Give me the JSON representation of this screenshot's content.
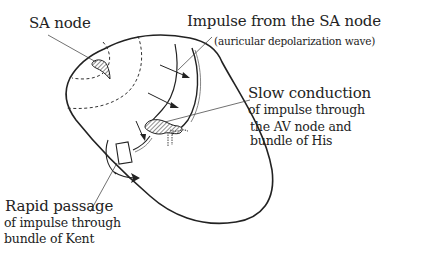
{
  "diagram": {
    "type": "anatomical-illustration",
    "labels": {
      "sa_node": "SA node",
      "impulse": {
        "line1": "Impulse from the SA node",
        "line2": "(auricular depolarization wave)"
      },
      "slow_conduction": {
        "line1": "Slow conduction",
        "line2": "of impulse   through",
        "line3": "the AV node and",
        "line4": "bundle of His"
      },
      "rapid_passage": {
        "line1": "Rapid passage",
        "line2": "of impulse   through",
        "line3": "bundle of Kent"
      }
    },
    "colors": {
      "ink": "#222222",
      "background": "#ffffff",
      "hatch": "#555555"
    }
  }
}
